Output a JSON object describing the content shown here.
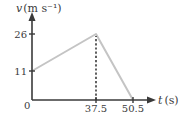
{
  "chart_data": {
    "type": "line",
    "title": "",
    "xlabel": "t (s)",
    "ylabel": "v (m s⁻¹)",
    "xlabel_var": "t",
    "xlabel_unit": "(s)",
    "ylabel_var": "v",
    "ylabel_unit": "(m s⁻¹)",
    "origin_label": "0",
    "x_ticks": [
      37.5,
      50.5
    ],
    "x_tick_labels": [
      "37.5",
      "50.5"
    ],
    "y_ticks": [
      11,
      26
    ],
    "y_tick_labels": [
      "11",
      "26"
    ],
    "xlim": [
      0,
      50.5
    ],
    "ylim": [
      0,
      26
    ],
    "grid": false,
    "legend": "none",
    "series": [
      {
        "name": "velocity",
        "color": "#c4c4c4",
        "points": [
          {
            "x": 0,
            "y": 11
          },
          {
            "x": 37.5,
            "y": 26
          },
          {
            "x": 50.5,
            "y": 0
          }
        ]
      }
    ],
    "annotations": [
      {
        "type": "dashed-vertical",
        "x": 37.5,
        "from_y": 0,
        "to_y": 26
      }
    ],
    "colors": {
      "axis": "#3a3a3a",
      "series": "#c4c4c4",
      "dashed": "#3a3a3a"
    }
  }
}
